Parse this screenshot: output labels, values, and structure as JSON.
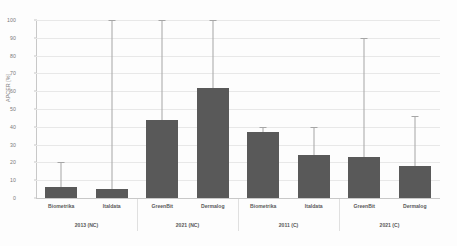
{
  "chart_data": {
    "type": "bar",
    "title": "",
    "xlabel": "",
    "ylabel": "APCER [%]",
    "ylim": [
      0,
      100
    ],
    "yticks": [
      0,
      10,
      20,
      30,
      40,
      50,
      60,
      70,
      80,
      90,
      100
    ],
    "grid": true,
    "legend": "none",
    "orientation": "vertical",
    "error_bars": "upper-only",
    "bar_color": "#595959",
    "errorbar_color": "#a6a6a6",
    "categories": [
      "Biometrika",
      "Italdata",
      "GreenBit",
      "Dermalog",
      "Biometrika",
      "Italdata",
      "GreenBit",
      "Dermalog"
    ],
    "values": [
      6,
      5,
      44,
      62,
      37,
      24,
      23,
      18
    ],
    "error_upper": [
      20,
      100,
      100,
      100,
      40,
      40,
      90,
      46
    ],
    "groups": [
      {
        "label": "2013 (NC)",
        "categories": [
          "Biometrika",
          "Italdata"
        ]
      },
      {
        "label": "2021 (NC)",
        "categories": [
          "GreenBit",
          "Dermalog"
        ]
      },
      {
        "label": "2011 (C)",
        "categories": [
          "Biometrika",
          "Italdata"
        ]
      },
      {
        "label": "2021 (C)",
        "categories": [
          "GreenBit",
          "Dermalog"
        ]
      }
    ]
  },
  "axis": {
    "y_title": "APCER [%]",
    "y_tick_labels": [
      "0",
      "10",
      "20",
      "30",
      "40",
      "50",
      "60",
      "70",
      "80",
      "90",
      "100"
    ]
  },
  "category_labels": [
    "Biometrika",
    "Italdata",
    "GreenBit",
    "Dermalog",
    "Biometrika",
    "Italdata",
    "GreenBit",
    "Dermalog"
  ],
  "group_labels": [
    "2013 (NC)",
    "2021 (NC)",
    "2011 (C)",
    "2021 (C)"
  ]
}
